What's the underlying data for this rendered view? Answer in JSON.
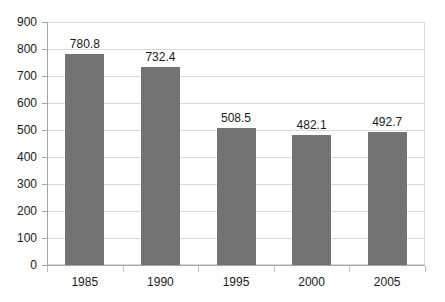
{
  "chart_data": {
    "type": "bar",
    "title": "",
    "subtitle": "",
    "xlabel": "",
    "ylabel": "",
    "categories": [
      "1985",
      "1990",
      "1995",
      "2000",
      "2005"
    ],
    "values": [
      780.8,
      732.4,
      508.5,
      482.1,
      492.7
    ],
    "data_labels": [
      "780.8",
      "732.4",
      "508.5",
      "482.1",
      "492.7"
    ],
    "series": [
      {
        "name": "",
        "values": [
          780.8,
          732.4,
          508.5,
          482.1,
          492.7
        ]
      }
    ],
    "ylim": [
      0,
      900
    ],
    "y_ticks": [
      0,
      100,
      200,
      300,
      400,
      500,
      600,
      700,
      800,
      900
    ],
    "y_tick_labels": [
      "0",
      "100",
      "200",
      "300",
      "400",
      "500",
      "600",
      "700",
      "800",
      "900"
    ],
    "grid": true,
    "grid_axis": "y",
    "legend": false,
    "legend_position": "none",
    "bar_color": "#737373",
    "grid_color": "#d9d9d9",
    "axis_color": "#a6a6a6",
    "text_color": "#1a1a1a",
    "background_color": "#ffffff"
  }
}
